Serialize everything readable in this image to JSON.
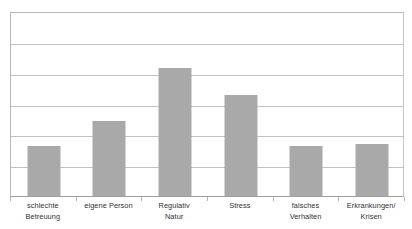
{
  "figure": {
    "title_remnant": "",
    "background": "#ffffff",
    "bar_color": "#a9a9a9",
    "gridline_color": "#c2c2c6",
    "axis_color": "#9d9da2",
    "label_color": "#2f2f33"
  },
  "chart_data": {
    "type": "bar",
    "title": "",
    "xlabel": "",
    "ylabel": "",
    "categories": [
      "schlechte Betreuung",
      "eigene Person",
      "Regulativ Natur",
      "Stress",
      "falsches Verhalten",
      "Erkrankungen/ Krisen"
    ],
    "category_lines": [
      [
        "schlechte",
        "Betreuung"
      ],
      [
        "eigene Person",
        ""
      ],
      [
        "Regulativ",
        "Natur"
      ],
      [
        "Stress",
        ""
      ],
      [
        "falsches",
        "Verhalten"
      ],
      [
        "Erkrankungen/",
        "Krisen"
      ]
    ],
    "values": [
      1.63,
      2.44,
      4.14,
      3.29,
      1.63,
      1.7
    ],
    "ylim": [
      0,
      6
    ],
    "ytick_values": [
      0,
      1,
      2,
      3,
      4,
      5,
      6
    ],
    "ytick_labels": [
      "",
      "",
      "",
      "",
      "",
      "",
      ""
    ],
    "grid": true,
    "grid_axis": "y",
    "legend": false,
    "legend_position": "none",
    "data_labels": false,
    "bar_width_px": 33,
    "series": [
      {
        "name": "Nennungen",
        "values": [
          1.63,
          2.44,
          4.14,
          3.29,
          1.63,
          1.7
        ]
      }
    ]
  }
}
